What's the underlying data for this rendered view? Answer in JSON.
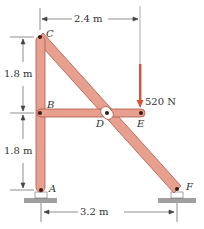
{
  "figure": {
    "points": {
      "A": "A",
      "B": "B",
      "C": "C",
      "D": "D",
      "E": "E",
      "F": "F"
    },
    "dimensions": {
      "top_horizontal": "2.4 m",
      "upper_vertical": "1.8 m",
      "lower_vertical": "1.8 m",
      "bottom_horizontal": "3.2 m"
    },
    "load": {
      "label": "520 N",
      "color": "#d9533a"
    },
    "colors": {
      "member": "#e8a08e",
      "member_edge": "#b0574a",
      "ground": "#a0a0a0"
    }
  }
}
